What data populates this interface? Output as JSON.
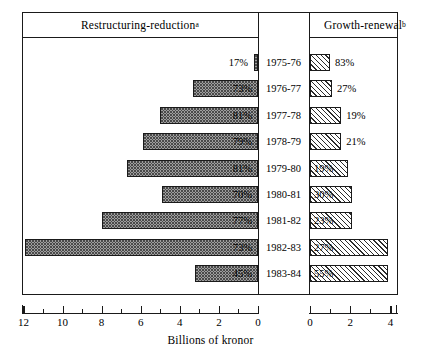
{
  "headers": {
    "left": "Restructuring-reduction",
    "left_note": "a",
    "right": "Growth-renewal",
    "right_note": "b"
  },
  "axis": {
    "title": "Billions of kronor",
    "left_ticks": [
      "12",
      "10",
      "8",
      "6",
      "4",
      "2",
      "0"
    ],
    "right_ticks": [
      "0",
      "2",
      "4"
    ]
  },
  "chart_data": {
    "type": "bar",
    "title": "",
    "subtitle": "",
    "xlabel": "Billions of kronor",
    "ylabel": "",
    "orientation": "horizontal",
    "layout": "back-to-back bidirectional bar chart with centered year labels",
    "grid": false,
    "legend_position": "header-panels",
    "left_axis_range": [
      13,
      0
    ],
    "right_axis_range": [
      0,
      4.4
    ],
    "units": "Billions of kronor",
    "categories": [
      "1975-76",
      "1976-77",
      "1977-78",
      "1978-79",
      "1979-80",
      "1980-81",
      "1981-82",
      "1982-83",
      "1983-84"
    ],
    "series": [
      {
        "name": "Restructuring-reduction",
        "note": "a",
        "side": "left",
        "pattern": "stipple-dots",
        "percent_labels": [
          "17%",
          "73%",
          "81%",
          "79%",
          "81%",
          "70%",
          "77%",
          "73%",
          "45%"
        ],
        "percents": [
          17,
          73,
          81,
          79,
          81,
          70,
          77,
          73,
          45
        ],
        "values": [
          0.2,
          3.3,
          5.0,
          5.9,
          6.7,
          4.9,
          8.0,
          11.9,
          3.2
        ]
      },
      {
        "name": "Growth-renewal",
        "note": "b",
        "side": "right",
        "pattern": "diagonal-hatch",
        "percent_labels": [
          "83%",
          "27%",
          "19%",
          "21%",
          "19%",
          "30%",
          "23%",
          "27%",
          "55%"
        ],
        "percents": [
          83,
          27,
          19,
          21,
          19,
          30,
          23,
          27,
          55
        ],
        "values": [
          1.0,
          1.1,
          1.55,
          1.55,
          1.9,
          2.1,
          2.1,
          3.9,
          3.9
        ]
      }
    ]
  }
}
